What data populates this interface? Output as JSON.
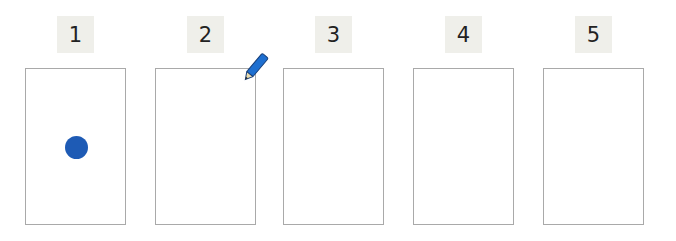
{
  "panels": [
    {
      "label": "1",
      "marker": "blue-dot"
    },
    {
      "label": "2",
      "marker": "pencil"
    },
    {
      "label": "3",
      "marker": null
    },
    {
      "label": "4",
      "marker": null
    },
    {
      "label": "5",
      "marker": null
    }
  ],
  "colors": {
    "dot": "#1e5bb5",
    "pencil": "#1e6fd0",
    "label_bg": "#efefea",
    "card_border": "#a9a9a9"
  }
}
